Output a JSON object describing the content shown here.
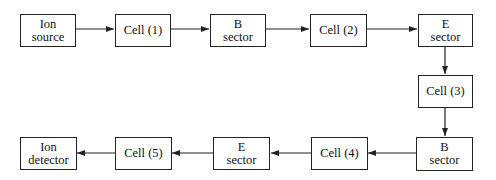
{
  "diagram": {
    "nodes": [
      {
        "id": "ion-source",
        "label": "Ion\nsource"
      },
      {
        "id": "cell-1",
        "label": "Cell (1)"
      },
      {
        "id": "b-sector-1",
        "label": "B\nsector"
      },
      {
        "id": "cell-2",
        "label": "Cell (2)"
      },
      {
        "id": "e-sector-1",
        "label": "E\nsector"
      },
      {
        "id": "cell-3",
        "label": "Cell (3)"
      },
      {
        "id": "b-sector-2",
        "label": "B\nsector"
      },
      {
        "id": "cell-4",
        "label": "Cell (4)"
      },
      {
        "id": "e-sector-2",
        "label": "E\nsector"
      },
      {
        "id": "cell-5",
        "label": "Cell (5)"
      },
      {
        "id": "ion-detector",
        "label": "Ion\ndetector"
      }
    ],
    "edges": [
      [
        "ion-source",
        "cell-1"
      ],
      [
        "cell-1",
        "b-sector-1"
      ],
      [
        "b-sector-1",
        "cell-2"
      ],
      [
        "cell-2",
        "e-sector-1"
      ],
      [
        "e-sector-1",
        "cell-3"
      ],
      [
        "cell-3",
        "b-sector-2"
      ],
      [
        "b-sector-2",
        "cell-4"
      ],
      [
        "cell-4",
        "e-sector-2"
      ],
      [
        "e-sector-2",
        "cell-5"
      ],
      [
        "cell-5",
        "ion-detector"
      ]
    ]
  }
}
